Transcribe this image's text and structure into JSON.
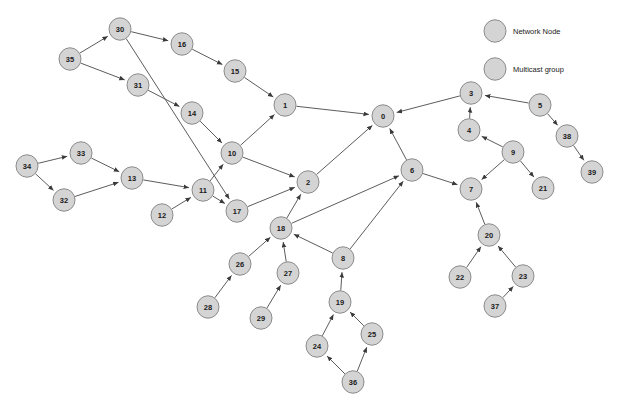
{
  "figure": {
    "width": 618,
    "height": 408,
    "background": "#ffffff",
    "node_fill": "#d4d4d4",
    "node_stroke": "#8c8c8c",
    "edge_color": "#4a4a4a",
    "label_color": "#1a1a1a"
  },
  "legend": {
    "items": [
      {
        "label": "Network Node",
        "shape": "circle",
        "fill": "#d4d4d4",
        "cx": 495,
        "cy": 31,
        "r": 11
      },
      {
        "label": "Multicast group",
        "shape": "circle",
        "fill": "#d4d4d4",
        "cx": 495,
        "cy": 69,
        "r": 11
      }
    ],
    "text_x": 513
  },
  "chart_data": {
    "type": "diagram",
    "subtype": "directed-network-graph",
    "title": "",
    "node_count": 40,
    "edge_count": 43,
    "node_radius": 11,
    "nodes": [
      {
        "id": "0",
        "label": "0",
        "x": 383,
        "y": 116
      },
      {
        "id": "1",
        "label": "1",
        "x": 285,
        "y": 105
      },
      {
        "id": "2",
        "label": "2",
        "x": 308,
        "y": 182
      },
      {
        "id": "3",
        "label": "3",
        "x": 471,
        "y": 93
      },
      {
        "id": "4",
        "label": "4",
        "x": 469,
        "y": 130
      },
      {
        "id": "5",
        "label": "5",
        "x": 540,
        "y": 105
      },
      {
        "id": "6",
        "label": "6",
        "x": 412,
        "y": 170
      },
      {
        "id": "7",
        "label": "7",
        "x": 471,
        "y": 189
      },
      {
        "id": "8",
        "label": "8",
        "x": 343,
        "y": 258
      },
      {
        "id": "9",
        "label": "9",
        "x": 513,
        "y": 152
      },
      {
        "id": "10",
        "label": "10",
        "x": 232,
        "y": 153
      },
      {
        "id": "11",
        "label": "11",
        "x": 203,
        "y": 190
      },
      {
        "id": "12",
        "label": "12",
        "x": 162,
        "y": 215
      },
      {
        "id": "13",
        "label": "13",
        "x": 132,
        "y": 178
      },
      {
        "id": "14",
        "label": "14",
        "x": 192,
        "y": 113
      },
      {
        "id": "15",
        "label": "15",
        "x": 235,
        "y": 71
      },
      {
        "id": "16",
        "label": "16",
        "x": 182,
        "y": 44
      },
      {
        "id": "17",
        "label": "17",
        "x": 237,
        "y": 211
      },
      {
        "id": "18",
        "label": "18",
        "x": 281,
        "y": 228
      },
      {
        "id": "19",
        "label": "19",
        "x": 340,
        "y": 302
      },
      {
        "id": "20",
        "label": "20",
        "x": 489,
        "y": 235
      },
      {
        "id": "21",
        "label": "21",
        "x": 543,
        "y": 188
      },
      {
        "id": "22",
        "label": "22",
        "x": 460,
        "y": 277
      },
      {
        "id": "23",
        "label": "23",
        "x": 523,
        "y": 276
      },
      {
        "id": "24",
        "label": "24",
        "x": 317,
        "y": 346
      },
      {
        "id": "25",
        "label": "25",
        "x": 372,
        "y": 334
      },
      {
        "id": "26",
        "label": "26",
        "x": 240,
        "y": 264
      },
      {
        "id": "27",
        "label": "27",
        "x": 288,
        "y": 273
      },
      {
        "id": "28",
        "label": "28",
        "x": 208,
        "y": 307
      },
      {
        "id": "29",
        "label": "29",
        "x": 261,
        "y": 318
      },
      {
        "id": "30",
        "label": "30",
        "x": 120,
        "y": 29
      },
      {
        "id": "31",
        "label": "31",
        "x": 138,
        "y": 85
      },
      {
        "id": "32",
        "label": "32",
        "x": 64,
        "y": 200
      },
      {
        "id": "33",
        "label": "33",
        "x": 81,
        "y": 153
      },
      {
        "id": "34",
        "label": "34",
        "x": 27,
        "y": 166
      },
      {
        "id": "35",
        "label": "35",
        "x": 70,
        "y": 59
      },
      {
        "id": "36",
        "label": "36",
        "x": 353,
        "y": 382
      },
      {
        "id": "37",
        "label": "37",
        "x": 495,
        "y": 306
      },
      {
        "id": "38",
        "label": "38",
        "x": 567,
        "y": 136
      },
      {
        "id": "39",
        "label": "39",
        "x": 592,
        "y": 172
      }
    ],
    "edges": [
      {
        "from": "35",
        "to": "30"
      },
      {
        "from": "35",
        "to": "31"
      },
      {
        "from": "30",
        "to": "16"
      },
      {
        "from": "16",
        "to": "15"
      },
      {
        "from": "15",
        "to": "1"
      },
      {
        "from": "31",
        "to": "14"
      },
      {
        "from": "14",
        "to": "10"
      },
      {
        "from": "10",
        "to": "1"
      },
      {
        "from": "1",
        "to": "0"
      },
      {
        "from": "10",
        "to": "2"
      },
      {
        "from": "11",
        "to": "10"
      },
      {
        "from": "13",
        "to": "11"
      },
      {
        "from": "12",
        "to": "11"
      },
      {
        "from": "11",
        "to": "17"
      },
      {
        "from": "30b",
        "to": "17",
        "from_id": "30b"
      },
      {
        "from": "17",
        "to": "2"
      },
      {
        "from": "34",
        "to": "33"
      },
      {
        "from": "34",
        "to": "32"
      },
      {
        "from": "33",
        "to": "13"
      },
      {
        "from": "32",
        "to": "13"
      },
      {
        "from": "2",
        "to": "0"
      },
      {
        "from": "18",
        "to": "2"
      },
      {
        "from": "18",
        "to": "6"
      },
      {
        "from": "26",
        "to": "18"
      },
      {
        "from": "28",
        "to": "26"
      },
      {
        "from": "27",
        "to": "18"
      },
      {
        "from": "29",
        "to": "27"
      },
      {
        "from": "8",
        "to": "18"
      },
      {
        "from": "8",
        "to": "6"
      },
      {
        "from": "19",
        "to": "8"
      },
      {
        "from": "24",
        "to": "19"
      },
      {
        "from": "25",
        "to": "19"
      },
      {
        "from": "36",
        "to": "24"
      },
      {
        "from": "36",
        "to": "25"
      },
      {
        "from": "6",
        "to": "0"
      },
      {
        "from": "6",
        "to": "7"
      },
      {
        "from": "3",
        "to": "0"
      },
      {
        "from": "4",
        "to": "3"
      },
      {
        "from": "5",
        "to": "3"
      },
      {
        "from": "5",
        "to": "38"
      },
      {
        "from": "38",
        "to": "39"
      },
      {
        "from": "9",
        "to": "4"
      },
      {
        "from": "9",
        "to": "7"
      },
      {
        "from": "9",
        "to": "21"
      },
      {
        "from": "20",
        "to": "7"
      },
      {
        "from": "22",
        "to": "20"
      },
      {
        "from": "23",
        "to": "20"
      },
      {
        "from": "37",
        "to": "23"
      }
    ],
    "edge_list_clean": [
      [
        "35",
        "30"
      ],
      [
        "35",
        "31"
      ],
      [
        "30",
        "16"
      ],
      [
        "16",
        "15"
      ],
      [
        "15",
        "1"
      ],
      [
        "31",
        "14"
      ],
      [
        "14",
        "10"
      ],
      [
        "10",
        "1"
      ],
      [
        "1",
        "0"
      ],
      [
        "10",
        "2"
      ],
      [
        "11",
        "10"
      ],
      [
        "13",
        "11"
      ],
      [
        "12",
        "11"
      ],
      [
        "11",
        "17"
      ],
      [
        "30",
        "17"
      ],
      [
        "17",
        "2"
      ],
      [
        "34",
        "33"
      ],
      [
        "34",
        "32"
      ],
      [
        "33",
        "13"
      ],
      [
        "32",
        "13"
      ],
      [
        "2",
        "0"
      ],
      [
        "18",
        "2"
      ],
      [
        "18",
        "6"
      ],
      [
        "26",
        "18"
      ],
      [
        "28",
        "26"
      ],
      [
        "27",
        "18"
      ],
      [
        "29",
        "27"
      ],
      [
        "8",
        "18"
      ],
      [
        "8",
        "6"
      ],
      [
        "19",
        "8"
      ],
      [
        "24",
        "19"
      ],
      [
        "25",
        "19"
      ],
      [
        "36",
        "24"
      ],
      [
        "36",
        "25"
      ],
      [
        "6",
        "0"
      ],
      [
        "6",
        "7"
      ],
      [
        "3",
        "0"
      ],
      [
        "4",
        "3"
      ],
      [
        "5",
        "3"
      ],
      [
        "5",
        "38"
      ],
      [
        "38",
        "39"
      ],
      [
        "9",
        "4"
      ],
      [
        "9",
        "7"
      ],
      [
        "9",
        "21"
      ],
      [
        "20",
        "7"
      ],
      [
        "22",
        "20"
      ],
      [
        "23",
        "20"
      ],
      [
        "37",
        "23"
      ]
    ]
  }
}
